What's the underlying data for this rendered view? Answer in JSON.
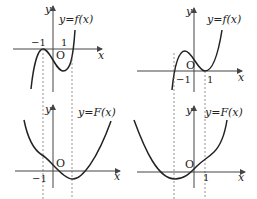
{
  "panels": [
    {
      "id": "top-left",
      "function_label": "y=f(x)",
      "axis_x": "x",
      "axis_y": "y",
      "origin": "O",
      "ticks": [
        "−1",
        "1"
      ]
    },
    {
      "id": "top-right",
      "function_label": "y=f(x)",
      "axis_x": "x",
      "axis_y": "y",
      "origin": "O",
      "ticks": [
        "−1",
        "1"
      ]
    },
    {
      "id": "bottom-left",
      "function_label": "y=F(x)",
      "axis_x": "x",
      "axis_y": "y",
      "origin": "O",
      "ticks": [
        "−1"
      ]
    },
    {
      "id": "bottom-right",
      "function_label": "y=F(x)",
      "axis_x": "x",
      "axis_y": "y",
      "origin": "O",
      "ticks": [
        "1"
      ]
    }
  ]
}
